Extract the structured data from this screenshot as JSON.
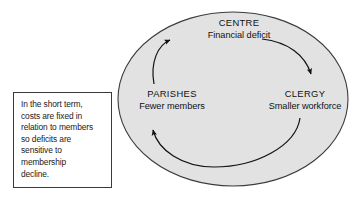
{
  "diagram": {
    "shape": "ellipse",
    "fill_color": "#e2e2e2",
    "stroke_color": "#3c3c3c",
    "background_color": "#ffffff",
    "nodes": [
      {
        "id": "centre",
        "title": "CENTRE",
        "subtitle": "Financial deficit",
        "position": "top"
      },
      {
        "id": "clergy",
        "title": "CLERGY",
        "subtitle": "Smaller workforce",
        "position": "right"
      },
      {
        "id": "parishes",
        "title": "PARISHES",
        "subtitle": "Fewer members",
        "position": "left"
      }
    ],
    "arrows": [
      {
        "id": "centre-to-clergy",
        "from": "centre",
        "to": "clergy"
      },
      {
        "id": "clergy-to-parishes",
        "from": "clergy",
        "to": "parishes"
      },
      {
        "id": "parishes-to-centre",
        "from": "parishes",
        "to": "centre"
      }
    ]
  },
  "note": {
    "text": "In the short term,\ncosts are fixed in\nrelation to members\nso deficits are\nsensitive to\nmembership\ndecline."
  }
}
